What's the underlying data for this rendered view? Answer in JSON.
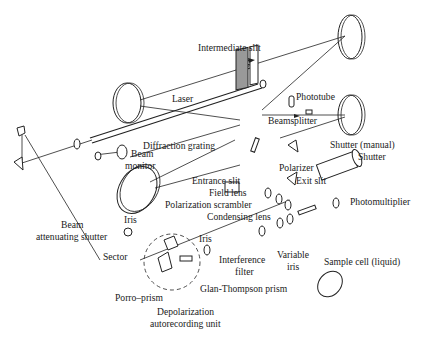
{
  "figure": {
    "labels": {
      "intermediate_slit": "Intermediate slit",
      "laser": "Laser",
      "phototube": "Phototube",
      "beamsplitter": "Beamsplitter",
      "beam_monitor_1": "Beam",
      "beam_monitor_2": "monitor",
      "diffraction_grating": "Diffraction grating",
      "shutter_manual": "Shutter (manual)",
      "shutter": "Shutter",
      "entrance_slit": "Entrance slit",
      "polarizer": "Polarizer",
      "exit_slit": "Exit slit",
      "field_lens": "Field lens",
      "polarization_scrambler": "Polarization scrambler",
      "condensing_lens": "Condensing lens",
      "photomultiplier": "Photomultiplier",
      "beam_attenuating_1": "Beam",
      "beam_attenuating_2": "attenuating shutter",
      "iris_left": "Iris",
      "iris_center": "Iris",
      "sector": "Sector",
      "interference_filter_1": "Interference",
      "interference_filter_2": "filter",
      "variable_iris_1": "Variable",
      "variable_iris_2": "iris",
      "sample_cell": "Sample cell (liquid)",
      "glan_thompson": "Glan-Thompson prism",
      "porro_prism": "Porro–prism",
      "depolarization_1": "Depolarization",
      "depolarization_2": "autorecording unit"
    }
  }
}
